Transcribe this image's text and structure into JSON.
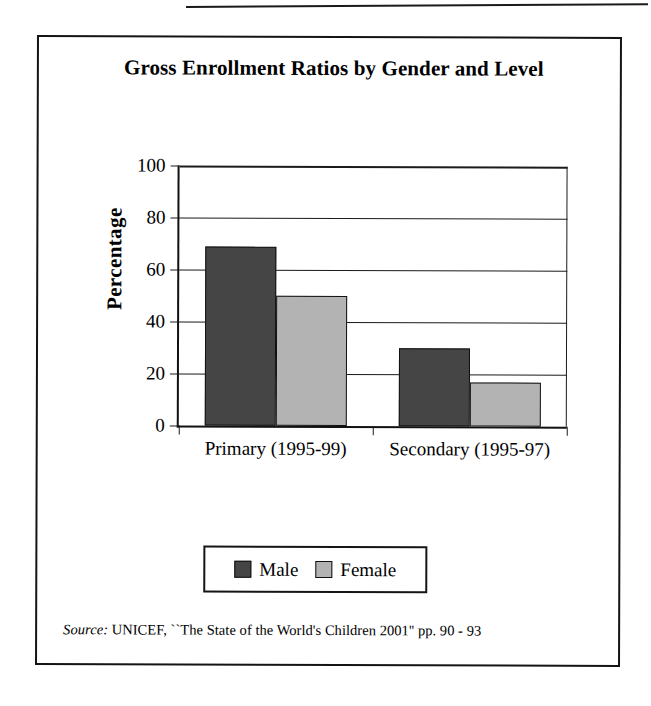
{
  "figure": {
    "title": "Gross Enrollment Ratios by Gender and Level",
    "source_label": "Source:",
    "source_text": " UNICEF, ``The State of the World's Children 2001'' pp. 90 - 93"
  },
  "chart_data": {
    "type": "bar",
    "title": "Gross Enrollment Ratios by Gender and Level",
    "xlabel": "",
    "ylabel": "Percentage",
    "ylim": [
      0,
      100
    ],
    "yticks": [
      0,
      20,
      40,
      60,
      80,
      100
    ],
    "ytick_labels": [
      "0",
      "20",
      "40",
      "60",
      "80",
      "100"
    ],
    "grid": true,
    "legend_position": "bottom",
    "categories": [
      "Primary (1995-99)",
      "Secondary (1995-97)"
    ],
    "series": [
      {
        "name": "Male",
        "color": "#454545",
        "values": [
          69,
          30
        ]
      },
      {
        "name": "Female",
        "color": "#b3b3b3",
        "values": [
          50,
          17
        ]
      }
    ]
  },
  "axis": {
    "yticks": [
      {
        "label": "100",
        "value": 100
      },
      {
        "label": "80",
        "value": 80
      },
      {
        "label": "60",
        "value": 60
      },
      {
        "label": "40",
        "value": 40
      },
      {
        "label": "20",
        "value": 20
      },
      {
        "label": "0",
        "value": 0
      }
    ],
    "ylabel": "Percentage",
    "categories": [
      {
        "label": "Primary (1995-99)"
      },
      {
        "label": "Secondary (1995-97)"
      }
    ]
  },
  "legend": {
    "entries": [
      {
        "label": "Male",
        "color": "#454545"
      },
      {
        "label": "Female",
        "color": "#b3b3b3"
      }
    ]
  }
}
